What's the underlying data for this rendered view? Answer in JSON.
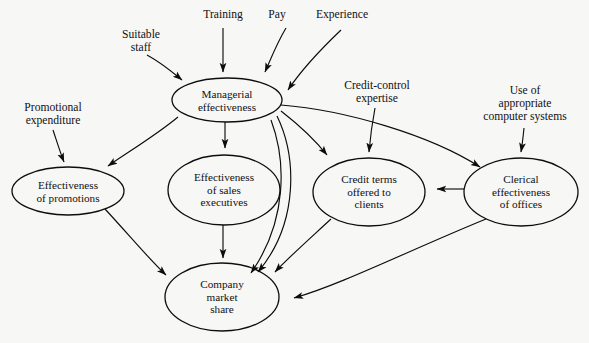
{
  "diagram": {
    "background_color": "#f7f7f6",
    "stroke_color": "#0d0d0d",
    "nodes": [
      {
        "id": "managerial",
        "label": "Managerial\neffectiveness",
        "cx": 227,
        "cy": 100,
        "rx": 55,
        "ry": 22
      },
      {
        "id": "promotions",
        "label": "Effectiveness\nof promotions",
        "cx": 68,
        "cy": 191,
        "rx": 56,
        "ry": 24
      },
      {
        "id": "sales",
        "label": "Effectiveness\nof sales\nexecutives",
        "cx": 224,
        "cy": 190,
        "rx": 56,
        "ry": 35
      },
      {
        "id": "credit",
        "label": "Credit terms\noffered to\nclients",
        "cx": 369,
        "cy": 192,
        "rx": 56,
        "ry": 34
      },
      {
        "id": "clerical",
        "label": "Clerical\neffectiveness\nof offices",
        "cx": 521,
        "cy": 192,
        "rx": 57,
        "ry": 34
      },
      {
        "id": "market_share",
        "label": "Company\nmarket\nshare",
        "cx": 222,
        "cy": 297,
        "rx": 57,
        "ry": 34
      }
    ],
    "external_labels": [
      {
        "id": "suitable_staff",
        "label": "Suitable\nstaff",
        "x": 108,
        "y": 28
      },
      {
        "id": "training",
        "label": "Training",
        "x": 198,
        "y": 8
      },
      {
        "id": "pay",
        "label": "Pay",
        "x": 262,
        "y": 8
      },
      {
        "id": "experience",
        "label": "Experience",
        "x": 308,
        "y": 8
      },
      {
        "id": "credit_control",
        "label": "Credit-control\nexpertise",
        "x": 342,
        "y": 78
      },
      {
        "id": "computer_systems",
        "label": "Use of\nappropriate\ncomputer systems",
        "x": 476,
        "y": 83
      },
      {
        "id": "promotional_exp",
        "label": "Promotional\nexpenditure",
        "x": 18,
        "y": 100
      }
    ],
    "edges": [
      {
        "id": "edge-suitable-staff-to-managerial",
        "from": "Suitable staff",
        "to": "Managerial effectiveness"
      },
      {
        "id": "edge-training-to-managerial",
        "from": "Training",
        "to": "Managerial effectiveness"
      },
      {
        "id": "edge-pay-to-managerial",
        "from": "Pay",
        "to": "Managerial effectiveness"
      },
      {
        "id": "edge-experience-to-managerial",
        "from": "Experience",
        "to": "Managerial effectiveness"
      },
      {
        "id": "edge-promotional-to-promotions",
        "from": "Promotional expenditure",
        "to": "Effectiveness of promotions"
      },
      {
        "id": "edge-credit-control-to-credit",
        "from": "Credit-control expertise",
        "to": "Credit terms offered to clients"
      },
      {
        "id": "edge-computer-systems-to-clerical",
        "from": "Use of appropriate computer systems",
        "to": "Clerical effectiveness of offices"
      },
      {
        "id": "edge-managerial-to-promotions",
        "from": "Managerial effectiveness",
        "to": "Effectiveness of promotions"
      },
      {
        "id": "edge-managerial-to-sales",
        "from": "Managerial effectiveness",
        "to": "Effectiveness of sales executives"
      },
      {
        "id": "edge-managerial-to-credit",
        "from": "Managerial effectiveness",
        "to": "Credit terms offered to clients"
      },
      {
        "id": "edge-managerial-to-clerical",
        "from": "Managerial effectiveness",
        "to": "Clerical effectiveness of offices"
      },
      {
        "id": "edge-managerial-to-market-share-a",
        "from": "Managerial effectiveness",
        "to": "Company market share"
      },
      {
        "id": "edge-managerial-to-market-share-b",
        "from": "Managerial effectiveness",
        "to": "Company market share"
      },
      {
        "id": "edge-promotions-to-market-share",
        "from": "Effectiveness of promotions",
        "to": "Company market share"
      },
      {
        "id": "edge-sales-to-market-share",
        "from": "Effectiveness of sales executives",
        "to": "Company market share"
      },
      {
        "id": "edge-credit-to-market-share",
        "from": "Credit terms offered to clients",
        "to": "Company market share"
      },
      {
        "id": "edge-clerical-to-credit",
        "from": "Clerical effectiveness of offices",
        "to": "Credit terms offered to clients"
      },
      {
        "id": "edge-clerical-to-market-share",
        "from": "Clerical effectiveness of offices",
        "to": "Company market share"
      }
    ]
  }
}
